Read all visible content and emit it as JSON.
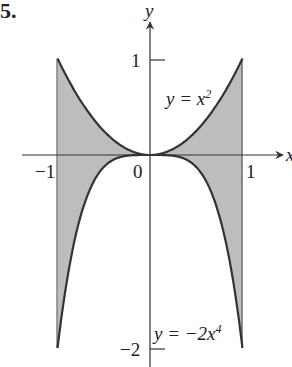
{
  "problem_number": "5.",
  "axes": {
    "x_label": "x",
    "y_label": "y"
  },
  "ticks": {
    "x_neg1": "−1",
    "x_zero": "0",
    "x_one": "1",
    "y_one": "1",
    "y_neg2": "−2"
  },
  "curves": {
    "upper": {
      "lhs": "y = x",
      "exp": "2"
    },
    "lower": {
      "lhs": "y = −2x",
      "exp": "4"
    }
  },
  "colors": {
    "fill": "#bdbdbd",
    "curve": "#333333",
    "axis": "#333333"
  },
  "chart_data": {
    "type": "area",
    "series": [
      {
        "name": "y = x^2",
        "x": [
          -1,
          -0.75,
          -0.5,
          -0.25,
          0,
          0.25,
          0.5,
          0.75,
          1
        ],
        "values": [
          1,
          0.5625,
          0.25,
          0.0625,
          0,
          0.0625,
          0.25,
          0.5625,
          1
        ]
      },
      {
        "name": "y = -2x^4",
        "x": [
          -1,
          -0.75,
          -0.5,
          -0.25,
          0,
          0.25,
          0.5,
          0.75,
          1
        ],
        "values": [
          -2,
          -0.633,
          -0.125,
          -0.0078,
          0,
          -0.0078,
          -0.125,
          -0.633,
          -2
        ]
      }
    ],
    "xlim": [
      -1.1,
      1.1
    ],
    "ylim": [
      -2,
      1
    ],
    "x_ticks": [
      -1,
      0,
      1
    ],
    "y_ticks": [
      -2,
      1
    ],
    "shaded_region": "between curves for -1 <= x <= 1"
  }
}
